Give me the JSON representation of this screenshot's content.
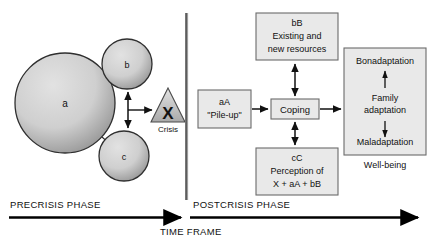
{
  "figure": {
    "phases": {
      "precrisis_label": "PRECRISIS PHASE",
      "postcrisis_label": "POSTCRISIS PHASE",
      "timeframe_label": "TIME FRAME"
    },
    "precrisis": {
      "circles": [
        {
          "id": "a",
          "label": "a",
          "cx": 65,
          "cy": 103,
          "r": 50
        },
        {
          "id": "b",
          "label": "b",
          "cx": 127,
          "cy": 64,
          "r": 25
        },
        {
          "id": "c",
          "label": "c",
          "cx": 124,
          "cy": 156,
          "r": 25
        }
      ],
      "crisis": {
        "symbol": "X",
        "label": "Crisis"
      }
    },
    "postcrisis": {
      "boxes": [
        {
          "id": "bB",
          "lines": [
            "bB",
            "Existing and",
            "new resources"
          ]
        },
        {
          "id": "aA",
          "lines": [
            "aA",
            "\"Pile-up\""
          ]
        },
        {
          "id": "coping",
          "lines": [
            "Coping"
          ]
        },
        {
          "id": "cC",
          "lines": [
            "cC",
            "Perception of",
            "X + aA + bB"
          ]
        }
      ],
      "outcome_box": {
        "top_label": "Bonadaptation",
        "middle_label_line1": "Family",
        "middle_label_line2": "adaptation",
        "bottom_label": "Maladaptation",
        "caption": "Well-being"
      }
    },
    "colors": {
      "box_fill": "#e9e9e9",
      "box_stroke": "#6b6b6b",
      "circle_edge": "#333333",
      "circle_light": "#d8d8d8",
      "circle_dark": "#8d8d8d",
      "divider": "#8a8a8a",
      "axis": "#000000",
      "text": "#111111"
    }
  }
}
